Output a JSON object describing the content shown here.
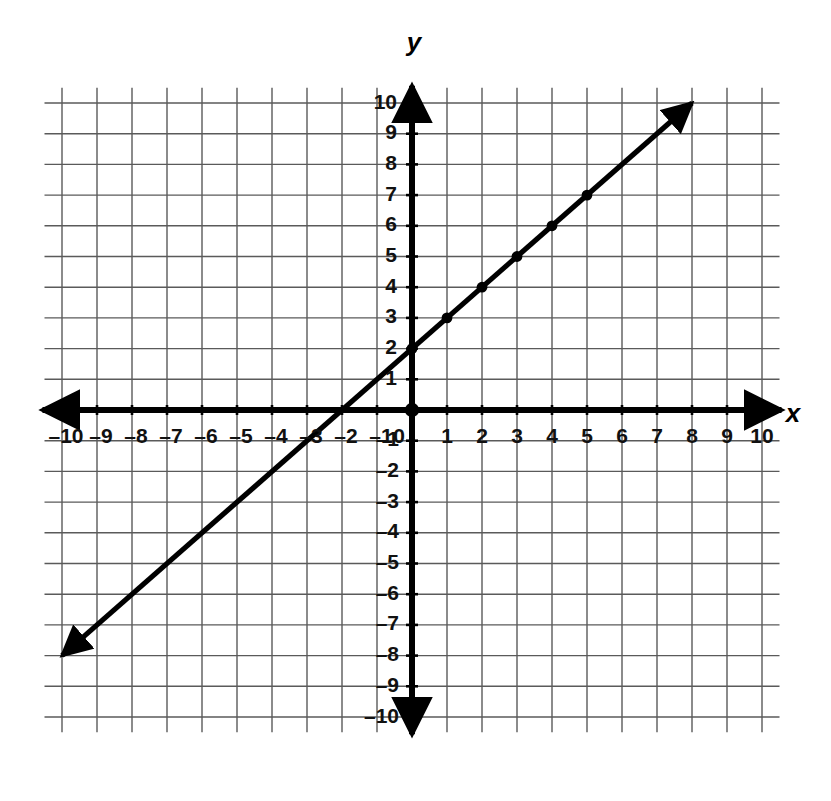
{
  "figure": {
    "kind": "coordinate-plane-line-graph",
    "background_color": "#ffffff",
    "grid_color": "#5a5a5a",
    "axis_color": "#000000",
    "line_color": "#000000"
  },
  "axes": {
    "x_axis_label": "x",
    "y_axis_label": "y",
    "origin_label": "0",
    "x_tick_labels_negative": [
      "–10",
      "–9",
      "–8",
      "–7",
      "–6",
      "–5",
      "–4",
      "–3",
      "–2",
      "–1"
    ],
    "x_tick_labels_positive": [
      "1",
      "2",
      "3",
      "4",
      "5",
      "6",
      "7",
      "8",
      "9",
      "10"
    ],
    "y_tick_labels_positive": [
      "1",
      "2",
      "3",
      "4",
      "5",
      "6",
      "7",
      "8",
      "9",
      "10"
    ],
    "y_tick_labels_negative": [
      "–1",
      "–2",
      "–3",
      "–4",
      "–5",
      "–6",
      "–7",
      "–8",
      "–9",
      "–10"
    ]
  },
  "chart_data": {
    "type": "line",
    "title": "",
    "xlabel": "x",
    "ylabel": "y",
    "xlim": [
      -10.5,
      10.5
    ],
    "ylim": [
      -10.5,
      10.5
    ],
    "xticks": [
      -10,
      -9,
      -8,
      -7,
      -6,
      -5,
      -4,
      -3,
      -2,
      -1,
      0,
      1,
      2,
      3,
      4,
      5,
      6,
      7,
      8,
      9,
      10
    ],
    "yticks": [
      -10,
      -9,
      -8,
      -7,
      -6,
      -5,
      -4,
      -3,
      -2,
      -1,
      0,
      1,
      2,
      3,
      4,
      5,
      6,
      7,
      8,
      9,
      10
    ],
    "grid": true,
    "grid_step": 1,
    "legend": "none",
    "series": [
      {
        "name": "y = x + 2",
        "equation": "y = x + 2",
        "slope": 1,
        "intercept": 2,
        "x_intercept": -2,
        "y_intercept": 2,
        "style": "solid",
        "arrow_start": true,
        "arrow_end": true,
        "endpoints": [
          {
            "x": -10,
            "y": -8
          },
          {
            "x": 8,
            "y": 10
          }
        ],
        "marked_points": [
          {
            "x": 0,
            "y": 2
          },
          {
            "x": 1,
            "y": 3
          },
          {
            "x": 2,
            "y": 4
          },
          {
            "x": 3,
            "y": 5
          },
          {
            "x": 4,
            "y": 6
          },
          {
            "x": 5,
            "y": 7
          }
        ]
      }
    ],
    "origin_point_marked": true
  }
}
